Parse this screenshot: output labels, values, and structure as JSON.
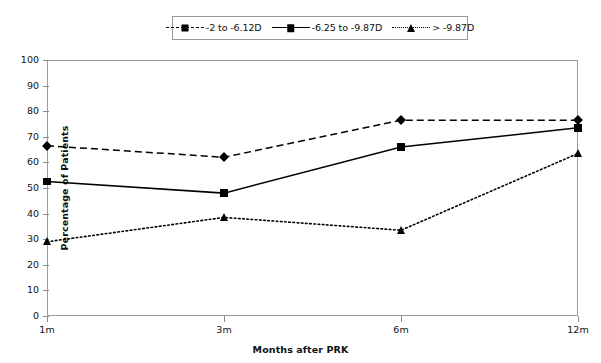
{
  "chart_data": {
    "type": "line",
    "title": "",
    "xlabel": "Months after PRK",
    "ylabel": "Percentage of Patients",
    "categories": [
      "1m",
      "3m",
      "6m",
      "12m"
    ],
    "ylim": [
      0,
      100
    ],
    "ytick_labels": [
      "0",
      "10",
      "20",
      "30",
      "40",
      "50",
      "60",
      "70",
      "80",
      "90",
      "100"
    ],
    "ytick_values": [
      0,
      10,
      20,
      30,
      40,
      50,
      60,
      70,
      80,
      90,
      100
    ],
    "grid": false,
    "legend_position": "top-center",
    "series": [
      {
        "name": "-2 to -6.12D",
        "marker": "diamond",
        "line_style": "dashed",
        "color": "#000000",
        "values": [
          66.5,
          62,
          76.5,
          76.5
        ]
      },
      {
        "name": "-6.25 to -9.87D",
        "marker": "square",
        "line_style": "solid",
        "color": "#000000",
        "values": [
          52.5,
          48,
          66,
          73.5
        ]
      },
      {
        "name": "> -9.87D",
        "marker": "triangle",
        "line_style": "dotted",
        "color": "#000000",
        "values": [
          29,
          38.5,
          33.5,
          63.5
        ]
      }
    ]
  },
  "legend": {
    "entries": [
      {
        "label": "-2 to -6.12D"
      },
      {
        "label": "-6.25 to -9.87D"
      },
      {
        "label": "> -9.87D"
      }
    ]
  },
  "axes": {
    "x_title": "Months after PRK",
    "y_title": "Percentage of Patients"
  }
}
